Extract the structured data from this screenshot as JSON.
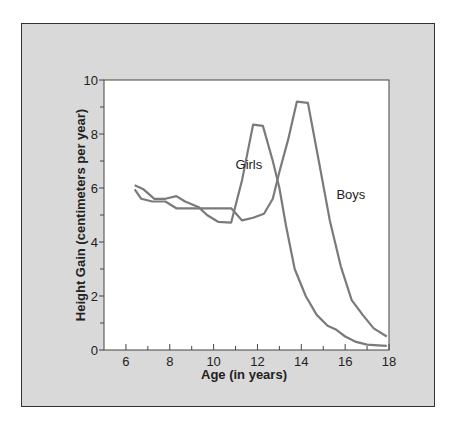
{
  "chart_data": {
    "type": "line",
    "title": "",
    "xlabel": "Age (in years)",
    "ylabel": "Height Gain (centimeters per year)",
    "xlim": [
      5,
      18
    ],
    "ylim": [
      0,
      10
    ],
    "x_ticks": [
      6,
      8,
      10,
      12,
      14,
      16,
      18
    ],
    "x_minor_ticks": [
      7,
      9,
      11,
      13,
      15,
      17
    ],
    "y_ticks": [
      0,
      2,
      4,
      6,
      8,
      10
    ],
    "y_minor_ticks": [
      1,
      3,
      5,
      7,
      9
    ],
    "grid": false,
    "legend": "inline labels",
    "series": [
      {
        "name": "Girls",
        "color": "#7a7a7a",
        "points": [
          [
            6.4,
            6.1
          ],
          [
            6.8,
            5.95
          ],
          [
            7.3,
            5.6
          ],
          [
            7.8,
            5.6
          ],
          [
            8.3,
            5.7
          ],
          [
            8.7,
            5.5
          ],
          [
            9.3,
            5.3
          ],
          [
            9.7,
            5.0
          ],
          [
            10.2,
            4.75
          ],
          [
            10.8,
            4.72
          ],
          [
            11.3,
            6.3
          ],
          [
            11.8,
            8.35
          ],
          [
            12.25,
            8.3
          ],
          [
            12.7,
            7.0
          ],
          [
            13.0,
            6.0
          ],
          [
            13.3,
            4.6
          ],
          [
            13.7,
            3.0
          ],
          [
            14.2,
            2.0
          ],
          [
            14.7,
            1.3
          ],
          [
            15.2,
            0.9
          ],
          [
            15.6,
            0.75
          ],
          [
            16.0,
            0.5
          ],
          [
            16.5,
            0.3
          ],
          [
            17.0,
            0.2
          ],
          [
            17.5,
            0.17
          ],
          [
            17.9,
            0.15
          ]
        ]
      },
      {
        "name": "Boys",
        "color": "#7a7a7a",
        "points": [
          [
            6.4,
            5.95
          ],
          [
            6.7,
            5.6
          ],
          [
            7.2,
            5.5
          ],
          [
            7.8,
            5.5
          ],
          [
            8.3,
            5.25
          ],
          [
            9.0,
            5.25
          ],
          [
            10.0,
            5.25
          ],
          [
            10.8,
            5.25
          ],
          [
            11.3,
            4.8
          ],
          [
            11.8,
            4.9
          ],
          [
            12.3,
            5.05
          ],
          [
            12.7,
            5.6
          ],
          [
            13.0,
            6.6
          ],
          [
            13.4,
            7.8
          ],
          [
            13.8,
            9.2
          ],
          [
            14.3,
            9.15
          ],
          [
            14.8,
            7.0
          ],
          [
            15.3,
            4.8
          ],
          [
            15.8,
            3.1
          ],
          [
            16.3,
            1.85
          ],
          [
            16.8,
            1.3
          ],
          [
            17.3,
            0.8
          ],
          [
            17.9,
            0.5
          ]
        ]
      }
    ],
    "annotations": [
      {
        "text": "Girls",
        "x": 11.0,
        "y": 6.7
      },
      {
        "text": "Boys",
        "x": 15.6,
        "y": 5.6
      }
    ]
  }
}
